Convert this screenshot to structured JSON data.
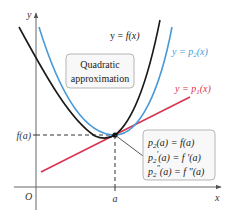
{
  "figure": {
    "axes": {
      "x_label": "x",
      "y_label": "y",
      "origin_label": "O",
      "a_tick_label": "a",
      "fa_tick_label": "f(a)"
    },
    "curves": {
      "f": {
        "label_prefix": "y = ",
        "label": "f(x)",
        "color": "#1a1a1a"
      },
      "p2": {
        "label_prefix": "y = p",
        "sub": "2",
        "label_suffix": "(x)",
        "color": "#4a9ad8"
      },
      "p1": {
        "label_prefix": "y = p",
        "sub": "1",
        "label_suffix": "(x)",
        "color": "#d9344f"
      }
    },
    "callout_box": {
      "line1": "Quadratic",
      "line2": "approximation"
    },
    "conditions_box": {
      "lines": [
        {
          "lhs_p": "p",
          "lhs_sub": "2",
          "lhs_prime": "",
          "lhs_rest": "(a) = ",
          "rhs": "f(a)"
        },
        {
          "lhs_p": "p",
          "lhs_sub": "2",
          "lhs_prime": "′",
          "lhs_rest": "(a) = ",
          "rhs": "f ′(a)"
        },
        {
          "lhs_p": "p",
          "lhs_sub": "2",
          "lhs_prime": "″",
          "lhs_rest": "(a) = ",
          "rhs": "f ″(a)"
        }
      ]
    }
  }
}
